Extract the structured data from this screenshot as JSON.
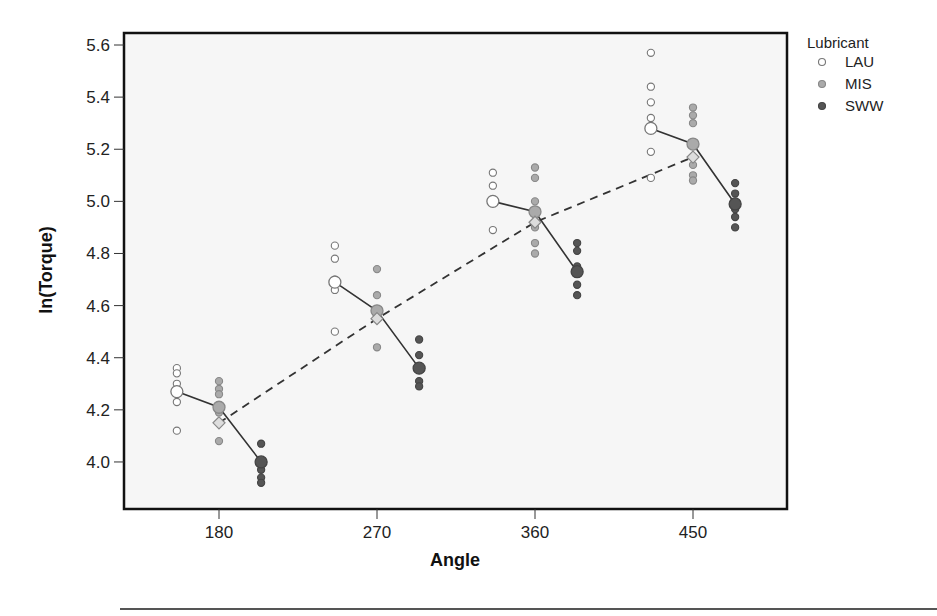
{
  "chart_data": {
    "type": "scatter",
    "title": "",
    "xlabel": "Angle",
    "ylabel": "ln(Torque)",
    "x_ticks": [
      180,
      270,
      360,
      450
    ],
    "y_ticks": [
      "4.0",
      "4.2",
      "4.4",
      "4.6",
      "4.8",
      "5.0",
      "5.2",
      "5.4",
      "5.6"
    ],
    "ylim": [
      3.82,
      5.64
    ],
    "grid": false,
    "legend": {
      "title": "Lubricant",
      "position": "right-top",
      "entries": [
        {
          "name": "LAU",
          "fill": "#ffffff",
          "stroke": "#777777"
        },
        {
          "name": "MIS",
          "fill": "#aaaaaa",
          "stroke": "#888888"
        },
        {
          "name": "SWW",
          "fill": "#555555",
          "stroke": "#444444"
        }
      ]
    },
    "series": [
      {
        "name": "LAU",
        "offset": -24,
        "points": {
          "180": [
            4.36,
            4.34,
            4.3,
            4.23,
            4.12
          ],
          "270": [
            4.83,
            4.78,
            4.7,
            4.66,
            4.5
          ],
          "360": [
            5.11,
            5.06,
            5.0,
            4.89
          ],
          "450": [
            5.57,
            5.44,
            5.38,
            5.32,
            5.19,
            5.09
          ]
        },
        "means": {
          "180": 4.27,
          "270": 4.69,
          "360": 5.0,
          "450": 5.28
        }
      },
      {
        "name": "MIS",
        "offset": 0,
        "points": {
          "180": [
            4.31,
            4.28,
            4.26,
            4.19,
            4.08
          ],
          "270": [
            4.74,
            4.64,
            4.55,
            4.44
          ],
          "360": [
            5.13,
            5.09,
            5.0,
            4.9,
            4.84,
            4.8
          ],
          "450": [
            5.36,
            5.33,
            5.3,
            5.14,
            5.1,
            5.08
          ]
        },
        "means": {
          "180": 4.21,
          "270": 4.58,
          "360": 4.96,
          "450": 5.22
        }
      },
      {
        "name": "SWW",
        "offset": 24,
        "points": {
          "180": [
            4.07,
            3.97,
            3.94,
            3.92
          ],
          "270": [
            4.47,
            4.41,
            4.31,
            4.29
          ],
          "360": [
            4.84,
            4.81,
            4.75,
            4.68,
            4.64
          ],
          "450": [
            5.07,
            5.03,
            4.97,
            4.94,
            4.9
          ]
        },
        "means": {
          "180": 4.0,
          "270": 4.36,
          "360": 4.73,
          "450": 4.99
        }
      }
    ],
    "overall_means": {
      "marker": "diamond",
      "line": "dashed",
      "x": [
        180,
        270,
        360,
        450
      ],
      "values": [
        4.15,
        4.55,
        4.92,
        5.17
      ]
    }
  }
}
